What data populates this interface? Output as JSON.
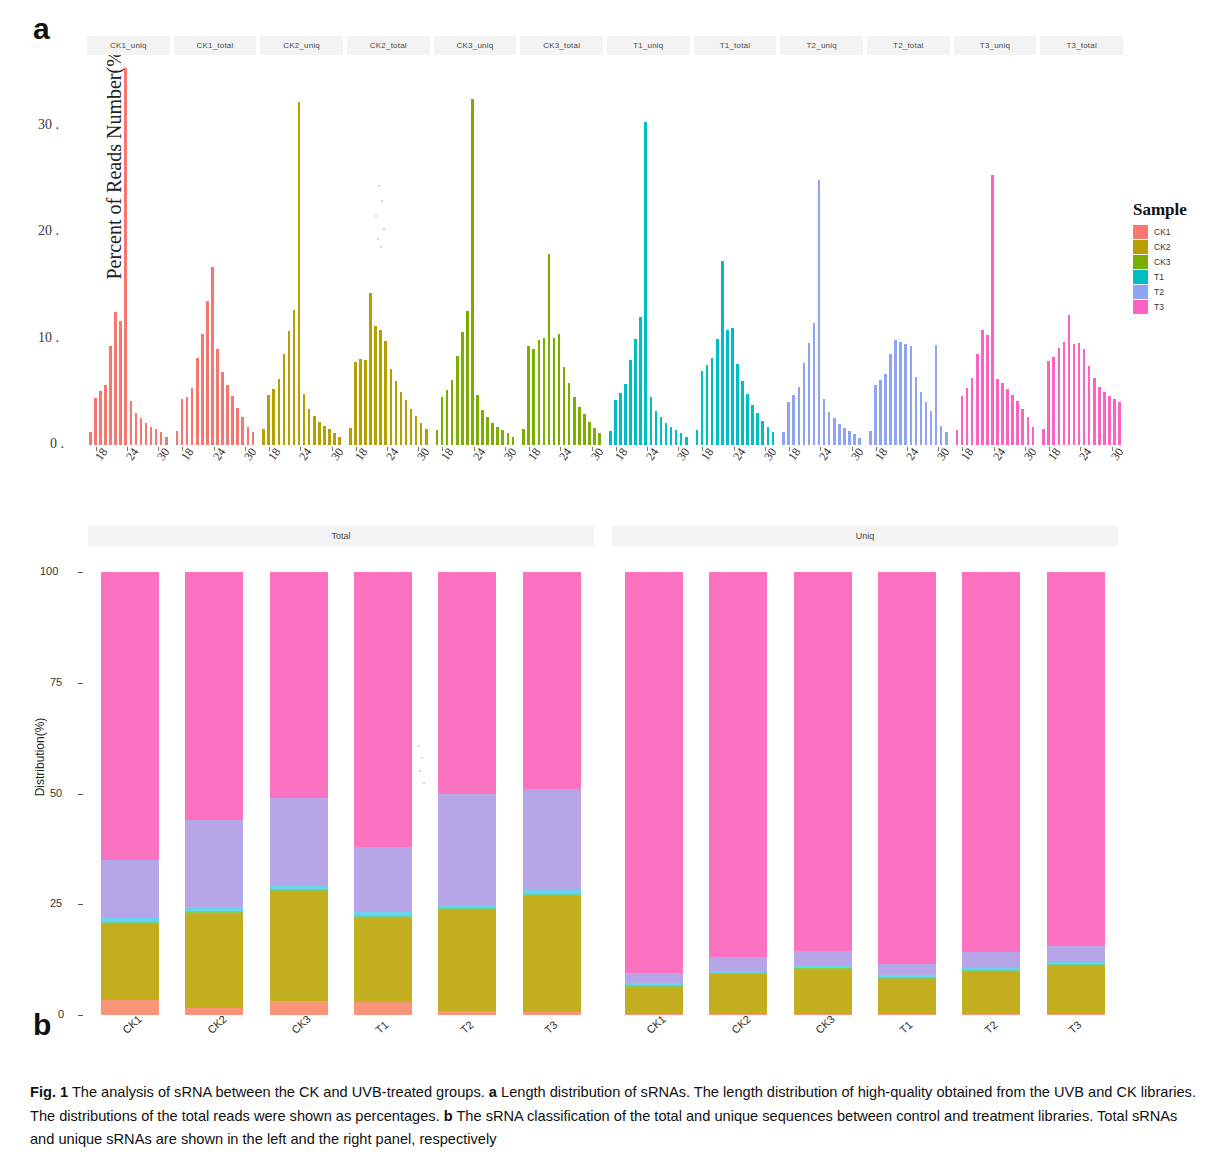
{
  "figure": {
    "panel_a_letter": "a",
    "panel_b_letter": "b",
    "caption_prefix": "Fig. 1",
    "caption_text": " The analysis of sRNA between the CK and UVB-treated groups. ",
    "caption_a_marker": "a",
    "caption_a_text": " Length distribution of sRNAs. The length distribution of high-quality obtained from the UVB and CK libraries. The distributions of the total reads were shown as percentages. ",
    "caption_b_marker": "b",
    "caption_b_text": " The sRNA classification of the total and unique sequences between control and treatment libraries. Total sRNAs and unique sRNAs are shown in the left and the right panel, respectively"
  },
  "panel_a": {
    "legend_title": "Sample",
    "y_title": "Percent of Reads Number(%)",
    "y_ticks": [
      "0",
      "10",
      "20",
      "30"
    ],
    "x_ticks": [
      "18",
      "24",
      "30"
    ],
    "facets": [
      "CK1_uniq",
      "CK1_total",
      "CK2_uniq",
      "CK2_total",
      "CK3_uniq",
      "CK3_total",
      "T1_uniq",
      "T1_total",
      "T2_uniq",
      "T2_total",
      "T3_uniq",
      "T3_total"
    ],
    "legend_items": [
      {
        "label": "CK1",
        "color": "#F8766D"
      },
      {
        "label": "CK2",
        "color": "#B79F00"
      },
      {
        "label": "CK3",
        "color": "#7CAE00"
      },
      {
        "label": "T1",
        "color": "#00BFC4"
      },
      {
        "label": "T2",
        "color": "#8EA5F5"
      },
      {
        "label": "T3",
        "color": "#FF61C3"
      }
    ]
  },
  "panel_b": {
    "legend_title": "sRNA",
    "y_title": "Distribution(%)",
    "y_ticks": [
      "0",
      "25",
      "50",
      "75",
      "100"
    ],
    "facets": [
      "Total",
      "Uniq"
    ],
    "x_labels": [
      "CK1",
      "CK2",
      "CK3",
      "T1",
      "T2",
      "T3"
    ],
    "legend_items": [
      {
        "label": "pre-miRNA",
        "color": "#FA9579"
      },
      {
        "label": "rRNA",
        "color": "#C3AE20"
      },
      {
        "label": "tRNA",
        "color": "#8CC751"
      },
      {
        "label": "snRNA",
        "color": "#6FCC9B"
      },
      {
        "label": "other_ncRNA",
        "color": "#67D3EE"
      },
      {
        "label": "Repeat",
        "color": "#B6A6E8"
      },
      {
        "label": "Unknown",
        "color": "#FA72C0"
      }
    ]
  },
  "chart_data": [
    {
      "type": "bar",
      "title": "a Length distribution of sRNAs",
      "xlabel": "",
      "ylabel": "Percent of Reads Number(%)",
      "ylim": [
        0,
        36
      ],
      "xlim": [
        17,
        32
      ],
      "x_ticks": [
        18,
        24,
        30
      ],
      "y_ticks": [
        0,
        10,
        20,
        30
      ],
      "grid": false,
      "legend_position": "right",
      "facet_variable": "Sample_Type",
      "x": [
        17,
        18,
        19,
        20,
        21,
        22,
        23,
        24,
        25,
        26,
        27,
        28,
        29,
        30,
        31,
        32
      ],
      "series": [
        {
          "name": "CK1_uniq",
          "color": "#F8766D",
          "values": [
            1.2,
            4.4,
            5.1,
            5.6,
            9.3,
            12.5,
            11.7,
            35.4,
            4.1,
            3.0,
            2.5,
            2.1,
            1.7,
            1.5,
            1.2,
            0.8
          ]
        },
        {
          "name": "CK1_total",
          "color": "#F8766D",
          "values": [
            1.3,
            4.3,
            4.5,
            5.4,
            8.2,
            10.4,
            13.5,
            16.7,
            9.0,
            6.9,
            5.6,
            4.6,
            3.5,
            2.6,
            1.7,
            1.2
          ]
        },
        {
          "name": "CK2_uniq",
          "color": "#B79F00",
          "values": [
            1.5,
            4.7,
            5.3,
            6.2,
            8.6,
            10.7,
            12.7,
            32.2,
            4.8,
            3.4,
            2.7,
            2.2,
            1.8,
            1.5,
            1.1,
            0.8
          ]
        },
        {
          "name": "CK2_total",
          "color": "#B79F00",
          "values": [
            1.6,
            7.8,
            8.1,
            8.0,
            14.3,
            11.2,
            10.8,
            9.8,
            7.1,
            6.0,
            5.0,
            4.2,
            3.4,
            2.7,
            2.1,
            1.5
          ]
        },
        {
          "name": "CK3_uniq",
          "color": "#7CAE00",
          "values": [
            1.4,
            4.5,
            5.2,
            6.1,
            8.4,
            10.6,
            12.6,
            32.5,
            4.7,
            3.3,
            2.6,
            2.1,
            1.7,
            1.4,
            1.1,
            0.8
          ]
        },
        {
          "name": "CK3_total",
          "color": "#7CAE00",
          "values": [
            1.5,
            9.3,
            9.0,
            9.9,
            10.1,
            18.0,
            10.1,
            10.4,
            7.3,
            5.8,
            4.5,
            3.6,
            2.9,
            2.2,
            1.6,
            1.1
          ]
        },
        {
          "name": "T1_uniq",
          "color": "#00BFC4",
          "values": [
            1.3,
            4.2,
            4.9,
            5.7,
            8.0,
            10.0,
            12.0,
            30.4,
            4.5,
            3.2,
            2.6,
            2.1,
            1.7,
            1.4,
            1.1,
            0.8
          ]
        },
        {
          "name": "T1_total",
          "color": "#00BFC4",
          "values": [
            1.4,
            7.0,
            7.5,
            8.2,
            10.0,
            17.3,
            10.8,
            11.0,
            7.6,
            6.0,
            4.8,
            3.8,
            3.0,
            2.3,
            1.7,
            1.2
          ]
        },
        {
          "name": "T2_uniq",
          "color": "#8EA5F5",
          "values": [
            1.2,
            4.0,
            4.7,
            5.5,
            7.7,
            9.6,
            11.5,
            24.9,
            4.3,
            3.1,
            2.5,
            2.0,
            1.6,
            1.3,
            1.0,
            0.7
          ]
        },
        {
          "name": "T2_total",
          "color": "#8EA5F5",
          "values": [
            1.3,
            5.6,
            6.1,
            6.7,
            8.6,
            9.9,
            9.7,
            9.5,
            9.3,
            6.4,
            5.0,
            4.0,
            3.2,
            9.4,
            1.8,
            1.2
          ]
        },
        {
          "name": "T3_uniq",
          "color": "#FF61C3",
          "values": [
            1.4,
            4.6,
            5.4,
            6.3,
            8.6,
            10.8,
            10.3,
            25.4,
            6.2,
            5.8,
            5.3,
            4.7,
            4.1,
            3.4,
            2.6,
            1.7
          ]
        },
        {
          "name": "T3_total",
          "color": "#FF61C3",
          "values": [
            1.5,
            7.9,
            8.3,
            9.1,
            9.7,
            12.2,
            9.5,
            9.6,
            9.0,
            7.4,
            6.3,
            5.5,
            5.0,
            4.6,
            4.3,
            4.0
          ]
        }
      ]
    },
    {
      "type": "bar",
      "subtype": "stacked-percent",
      "title": "b sRNA classification of total and unique sequences",
      "xlabel": "",
      "ylabel": "Distribution(%)",
      "ylim": [
        0,
        100
      ],
      "y_ticks": [
        0,
        25,
        50,
        75,
        100
      ],
      "grid": false,
      "legend_position": "right",
      "facets": [
        "Total",
        "Uniq"
      ],
      "categories": [
        "CK1",
        "CK2",
        "CK3",
        "T1",
        "T2",
        "T3"
      ],
      "stack_order": [
        "pre-miRNA",
        "rRNA",
        "tRNA",
        "snRNA",
        "other_ncRNA",
        "Repeat",
        "Unknown"
      ],
      "panels": [
        {
          "facet": "Total",
          "series": [
            {
              "name": "pre-miRNA",
              "color": "#FA9579",
              "values": [
                3.5,
                1.5,
                3.2,
                3.0,
                0.8,
                0.6
              ]
            },
            {
              "name": "rRNA",
              "color": "#C3AE20",
              "values": [
                17.0,
                21.5,
                24.8,
                18.8,
                22.8,
                26.3
              ]
            },
            {
              "name": "tRNA",
              "color": "#8CC751",
              "values": [
                0.3,
                0.3,
                0.3,
                0.3,
                0.3,
                0.3
              ]
            },
            {
              "name": "snRNA",
              "color": "#6FCC9B",
              "values": [
                0.2,
                0.2,
                0.2,
                0.2,
                0.2,
                0.2
              ]
            },
            {
              "name": "other_ncRNA",
              "color": "#67D3EE",
              "values": [
                0.8,
                0.9,
                0.9,
                0.9,
                0.8,
                0.8
              ]
            },
            {
              "name": "Repeat",
              "color": "#B6A6E8",
              "values": [
                13.2,
                19.6,
                19.6,
                14.8,
                25.1,
                22.8
              ]
            },
            {
              "name": "Unknown",
              "color": "#FA72C0",
              "values": [
                65.0,
                56.0,
                51.0,
                62.0,
                50.0,
                49.0
              ]
            }
          ]
        },
        {
          "facet": "Uniq",
          "series": [
            {
              "name": "pre-miRNA",
              "color": "#FA9579",
              "values": [
                0.2,
                0.2,
                0.2,
                0.2,
                0.2,
                0.2
              ]
            },
            {
              "name": "rRNA",
              "color": "#C3AE20",
              "values": [
                6.2,
                9.0,
                10.2,
                8.0,
                9.6,
                11.0
              ]
            },
            {
              "name": "tRNA",
              "color": "#8CC751",
              "values": [
                0.2,
                0.2,
                0.2,
                0.2,
                0.2,
                0.2
              ]
            },
            {
              "name": "snRNA",
              "color": "#6FCC9B",
              "values": [
                0.1,
                0.1,
                0.1,
                0.1,
                0.1,
                0.1
              ]
            },
            {
              "name": "other_ncRNA",
              "color": "#67D3EE",
              "values": [
                0.5,
                0.5,
                0.5,
                0.5,
                0.5,
                0.5
              ]
            },
            {
              "name": "Repeat",
              "color": "#B6A6E8",
              "values": [
                2.3,
                3.2,
                3.3,
                2.6,
                3.6,
                3.6
              ]
            },
            {
              "name": "Unknown",
              "color": "#FA72C0",
              "values": [
                90.5,
                86.8,
                85.5,
                88.4,
                85.8,
                84.4
              ]
            }
          ]
        }
      ]
    }
  ]
}
